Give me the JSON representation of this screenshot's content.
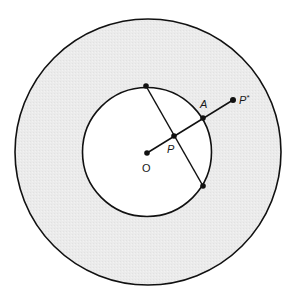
{
  "diagram": {
    "type": "geometry-inversion",
    "colors": {
      "background": "#ffffff",
      "annulus_fill": "#ebebeb",
      "inner_fill": "#ffffff",
      "stroke": "#111111"
    },
    "points": {
      "O": {
        "label": "O"
      },
      "P": {
        "label": "P"
      },
      "A": {
        "label": "A"
      },
      "P_star": {
        "label": "P",
        "superscript": "*"
      },
      "chord_top": {
        "label": ""
      },
      "chord_bottom": {
        "label": ""
      }
    },
    "segments": [
      {
        "from": "O",
        "to": "P_star",
        "name": "ray-op"
      },
      {
        "from": "chord_top",
        "to": "chord_bottom",
        "name": "chord"
      }
    ],
    "circles": [
      {
        "name": "outer-circle",
        "center": "O",
        "shaded": true
      },
      {
        "name": "inner-circle",
        "center": "O",
        "shaded": false
      }
    ]
  }
}
